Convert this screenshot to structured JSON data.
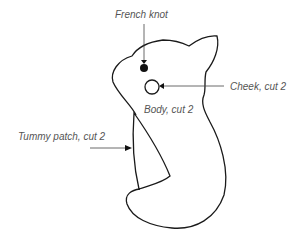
{
  "diagram": {
    "labels": {
      "french_knot": "French knot",
      "cheek": "Cheek, cut 2",
      "body": "Body, cut 2",
      "tummy": "Tummy patch, cut 2"
    },
    "colors": {
      "outline": "#1a1a1a",
      "label_text": "#555555",
      "leader_line": "#444444",
      "background": "#ffffff"
    }
  }
}
